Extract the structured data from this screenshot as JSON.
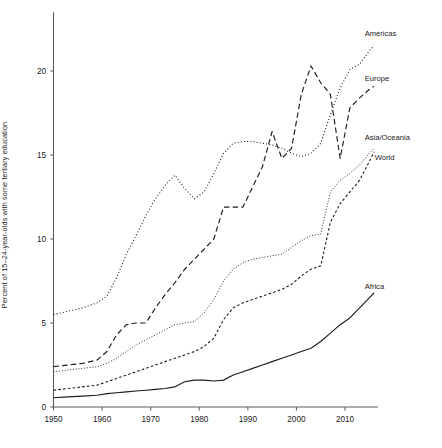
{
  "chart_data": {
    "type": "line",
    "title": "",
    "subtitle": "",
    "xlabel": "",
    "ylabel": "Percent of 15–24-year-olds with some tertiary education",
    "xlim": [
      1948,
      2017
    ],
    "ylim": [
      0,
      23.5
    ],
    "grid": false,
    "legend_position": "right-inline-labels",
    "xticks": [
      "1950",
      "1960",
      "1970",
      "1980",
      "1990",
      "2000",
      "2010"
    ],
    "xtick_values": [
      1950,
      1960,
      1970,
      1980,
      1990,
      2000,
      2010
    ],
    "yticks": [
      "0",
      "5",
      "10",
      "15",
      "20"
    ],
    "ytick_values": [
      0,
      5,
      10,
      15,
      20
    ],
    "series": [
      {
        "name": "Americas",
        "style": "dotted",
        "dash": "1,2.2",
        "width": 1.1,
        "color": "#1c1c1c",
        "label_x": 2012,
        "label_y": 22.1,
        "x": [
          1950,
          1953,
          1956,
          1959,
          1961,
          1963,
          1965,
          1967,
          1969,
          1971,
          1973,
          1975,
          1977,
          1979,
          1981,
          1983,
          1985,
          1987,
          1989,
          1991,
          1993,
          1995,
          1997,
          1999,
          2001,
          2003,
          2005,
          2007,
          2009,
          2011,
          2013,
          2015,
          2016
        ],
        "y": [
          5.5,
          5.7,
          5.9,
          6.2,
          6.6,
          7.7,
          9.1,
          10.2,
          11.4,
          12.4,
          13.2,
          13.8,
          13.0,
          12.4,
          12.8,
          13.9,
          15.1,
          15.7,
          15.8,
          15.8,
          15.7,
          15.6,
          15.4,
          15.1,
          14.9,
          15.1,
          15.7,
          17.4,
          19.0,
          20.1,
          20.4,
          21.2,
          21.5
        ]
      },
      {
        "name": "Europe",
        "style": "dashed-long",
        "dash": "5.5,3.2",
        "width": 1.15,
        "color": "#1c1c1c",
        "label_x": 2012,
        "label_y": 19.4,
        "x": [
          1950,
          1953,
          1956,
          1959,
          1961,
          1963,
          1965,
          1967,
          1969,
          1971,
          1973,
          1975,
          1977,
          1979,
          1981,
          1983,
          1985,
          1987,
          1989,
          1991,
          1993,
          1995,
          1997,
          1999,
          2001,
          2003,
          2005,
          2007,
          2009,
          2011,
          2013,
          2015,
          2016
        ],
        "y": [
          2.4,
          2.5,
          2.6,
          2.8,
          3.3,
          4.3,
          4.9,
          5.0,
          5.0,
          5.9,
          6.7,
          7.4,
          8.2,
          8.8,
          9.4,
          10.0,
          11.9,
          11.9,
          11.9,
          13.1,
          14.3,
          16.4,
          14.8,
          15.4,
          18.6,
          20.3,
          19.3,
          18.6,
          14.8,
          17.8,
          18.4,
          18.9,
          19.1
        ]
      },
      {
        "name": "Asia/Oceania",
        "style": "dotted-fine",
        "dash": "0.9,1.9",
        "width": 1.0,
        "color": "#1c1c1c",
        "label_x": 2012,
        "label_y": 15.9,
        "x": [
          1950,
          1953,
          1956,
          1959,
          1961,
          1963,
          1965,
          1967,
          1969,
          1971,
          1973,
          1975,
          1977,
          1979,
          1981,
          1983,
          1985,
          1987,
          1989,
          1991,
          1993,
          1995,
          1997,
          1999,
          2001,
          2003,
          2005,
          2007,
          2009,
          2011,
          2013,
          2015,
          2016
        ],
        "y": [
          2.1,
          2.2,
          2.3,
          2.4,
          2.6,
          2.9,
          3.3,
          3.7,
          4.0,
          4.3,
          4.6,
          4.9,
          5.0,
          5.1,
          5.6,
          6.4,
          7.5,
          8.2,
          8.6,
          8.8,
          8.9,
          9.0,
          9.1,
          9.5,
          9.9,
          10.2,
          10.3,
          12.8,
          13.5,
          13.9,
          14.4,
          15.1,
          15.4
        ]
      },
      {
        "name": "World",
        "style": "dashed-short",
        "dash": "2.6,2.2",
        "width": 1.1,
        "color": "#1c1c1c",
        "label_x": 2012,
        "label_y": 14.7,
        "x": [
          1950,
          1953,
          1956,
          1959,
          1961,
          1963,
          1965,
          1967,
          1969,
          1971,
          1973,
          1975,
          1977,
          1979,
          1981,
          1983,
          1985,
          1987,
          1989,
          1991,
          1993,
          1995,
          1997,
          1999,
          2001,
          2003,
          2005,
          2007,
          2009,
          2011,
          2013,
          2015,
          2016
        ],
        "y": [
          1.0,
          1.1,
          1.2,
          1.3,
          1.5,
          1.7,
          1.9,
          2.1,
          2.3,
          2.5,
          2.7,
          2.9,
          3.1,
          3.3,
          3.6,
          4.1,
          5.2,
          5.9,
          6.2,
          6.4,
          6.6,
          6.8,
          7.0,
          7.3,
          7.8,
          8.2,
          8.4,
          11.0,
          12.1,
          12.8,
          13.5,
          14.6,
          15.2
        ]
      },
      {
        "name": "Africa",
        "style": "solid",
        "dash": "",
        "width": 1.15,
        "color": "#1c1c1c",
        "label_x": 2012,
        "label_y": 7.0,
        "x": [
          1950,
          1953,
          1956,
          1959,
          1961,
          1963,
          1965,
          1967,
          1969,
          1971,
          1973,
          1975,
          1977,
          1979,
          1981,
          1983,
          1985,
          1987,
          1989,
          1991,
          1993,
          1995,
          1997,
          1999,
          2001,
          2003,
          2005,
          2007,
          2009,
          2011,
          2013,
          2015,
          2016
        ],
        "y": [
          0.55,
          0.6,
          0.65,
          0.7,
          0.8,
          0.85,
          0.9,
          0.95,
          1.0,
          1.05,
          1.1,
          1.2,
          1.5,
          1.6,
          1.6,
          1.55,
          1.6,
          1.9,
          2.1,
          2.3,
          2.5,
          2.7,
          2.9,
          3.1,
          3.3,
          3.5,
          3.9,
          4.4,
          4.9,
          5.3,
          5.9,
          6.5,
          6.8
        ]
      }
    ]
  }
}
